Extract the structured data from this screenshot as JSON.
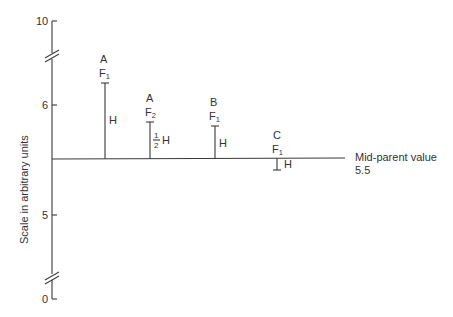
{
  "diagram": {
    "y_axis_label": "Scale in arbitrary units",
    "ticks": [
      {
        "label": "10",
        "y": 21
      },
      {
        "label": "6",
        "y": 105
      },
      {
        "label": "5",
        "y": 215
      },
      {
        "label": "0",
        "y": 299
      }
    ],
    "axis_breaks": [
      55,
      277
    ],
    "baseline": {
      "label_line1": "Mid-parent value",
      "label_line2": "5.5"
    },
    "bars": [
      {
        "cross": "A",
        "gen": "F",
        "gen_sub": "1",
        "effect": "H",
        "direction": "up"
      },
      {
        "cross": "A",
        "gen": "F",
        "gen_sub": "2",
        "effect_num": "1",
        "effect_den": "2",
        "effect": "H",
        "direction": "up"
      },
      {
        "cross": "B",
        "gen": "F",
        "gen_sub": "1",
        "effect": "H",
        "direction": "up"
      },
      {
        "cross": "C",
        "gen": "F",
        "gen_sub": "1",
        "effect": "H",
        "direction": "down"
      }
    ]
  }
}
